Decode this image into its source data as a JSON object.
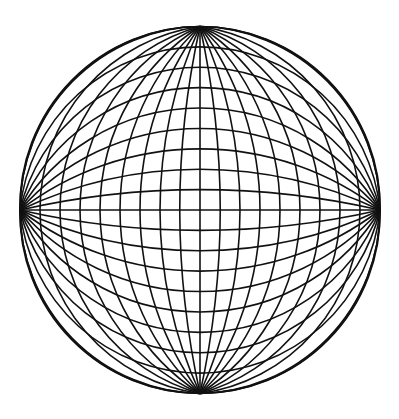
{
  "figure": {
    "type": "globular-graticule",
    "stroke_color": "#111111",
    "background_color": "#ffffff",
    "stroke_width": 1.6,
    "outline": {
      "cx": 200,
      "cy": 210,
      "rx": 180,
      "ry": 183.5
    },
    "poles": {
      "north": [
        200,
        26.5
      ],
      "south": [
        200,
        393.5
      ],
      "west": [
        20,
        210
      ],
      "east": [
        380,
        210
      ]
    },
    "meridians": {
      "count_each_side": 9,
      "spacing_px": 20,
      "central_line": true
    },
    "parallels": {
      "count_each_side": 9,
      "spacing_px": 20.39,
      "central_line": true
    }
  },
  "caption": {
    "text": "— cropped, illegible line of text at bottom edge —"
  }
}
